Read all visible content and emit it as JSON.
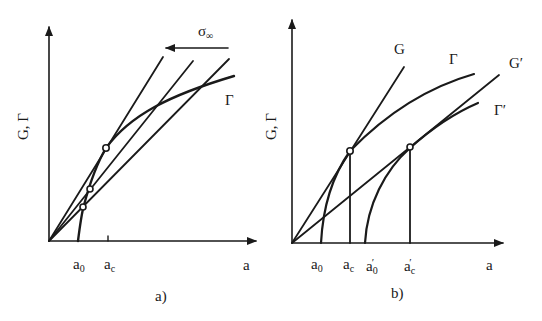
{
  "panels": [
    {
      "id": "a",
      "caption": "a)",
      "y_axis_label": "G, Γ",
      "x_axis_label": "a",
      "x_ticks": [
        {
          "base": "a",
          "sub": "0"
        },
        {
          "base": "a",
          "sub": "c"
        }
      ],
      "curve_label": "Γ",
      "arrow_label_base": "σ",
      "arrow_label_sub": "∞",
      "description": "Three straight G lines from origin (rotating with stress σ∞) and resistance curve Γ starting at a0; tangency/intersection points marked by circles"
    },
    {
      "id": "b",
      "caption": "b)",
      "y_axis_label": "G, Γ",
      "x_axis_label": "a",
      "x_ticks": [
        {
          "base": "a",
          "sub": "0",
          "prime": ""
        },
        {
          "base": "a",
          "sub": "c",
          "prime": ""
        },
        {
          "base": "a",
          "sub": "0",
          "prime": "′"
        },
        {
          "base": "a",
          "sub": "c",
          "prime": "′"
        }
      ],
      "curve_labels": {
        "G": "G",
        "Gamma": "Γ",
        "G_prime": "G′",
        "Gamma_prime": "Γ′"
      },
      "description": "Two R-curves Γ and Γ′ starting at a0 and a0′ with tangent G lines G and G′ from origin; critical points at ac and ac′"
    }
  ]
}
